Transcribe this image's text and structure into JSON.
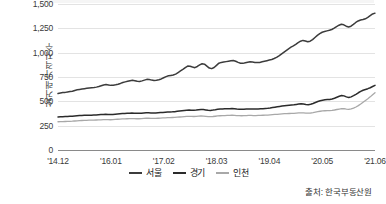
{
  "chart_data": {
    "type": "line",
    "title": "",
    "subtitle": "",
    "xlabel": "",
    "ylabel": "실거래 가격지수",
    "ylim": [
      0,
      1500
    ],
    "yticks": [
      0,
      250,
      500,
      750,
      1000,
      1250,
      1500
    ],
    "ytick_labels": [
      "0",
      "250",
      "500",
      "750",
      "1,000",
      "1,250",
      "1,500"
    ],
    "grid": true,
    "legend_position": "bottom-center",
    "xtick_labels": [
      "'14.12",
      "'16.01",
      "'17.02",
      "'18.03",
      "'19.04",
      "'20.05",
      "'21.06"
    ],
    "x_start": "'14.12",
    "x_end": "'21.06",
    "source": "출처: 한국부동산원",
    "series": [
      {
        "name": "서울",
        "color": "#3c3c3c",
        "values": [
          580,
          585,
          590,
          592,
          596,
          600,
          604,
          612,
          618,
          622,
          626,
          630,
          634,
          638,
          640,
          642,
          646,
          652,
          660,
          668,
          672,
          668,
          664,
          666,
          670,
          676,
          684,
          694,
          700,
          706,
          712,
          716,
          712,
          706,
          704,
          710,
          718,
          726,
          724,
          718,
          714,
          716,
          722,
          730,
          742,
          754,
          762,
          766,
          770,
          780,
          796,
          812,
          828,
          846,
          862,
          860,
          852,
          846,
          858,
          874,
          886,
          882,
          862,
          842,
          836,
          848,
          870,
          892,
          900,
          904,
          908,
          912,
          916,
          920,
          912,
          900,
          892,
          890,
          896,
          902,
          906,
          904,
          900,
          898,
          900,
          906,
          912,
          918,
          924,
          930,
          940,
          952,
          968,
          986,
          1004,
          1022,
          1040,
          1056,
          1070,
          1086,
          1104,
          1118,
          1126,
          1120,
          1112,
          1118,
          1134,
          1156,
          1178,
          1196,
          1210,
          1218,
          1224,
          1230,
          1238,
          1252,
          1268,
          1282,
          1292,
          1286,
          1272,
          1264,
          1272,
          1290,
          1310,
          1326,
          1336,
          1340,
          1348,
          1362,
          1380,
          1398,
          1406
        ]
      },
      {
        "name": "경기",
        "color": "#2b2b2b",
        "values": [
          340,
          341,
          342,
          343,
          344,
          346,
          348,
          350,
          352,
          354,
          355,
          356,
          357,
          358,
          358,
          359,
          360,
          362,
          364,
          366,
          367,
          366,
          365,
          366,
          368,
          370,
          372,
          374,
          376,
          377,
          378,
          379,
          378,
          377,
          377,
          378,
          380,
          382,
          382,
          381,
          380,
          380,
          382,
          384,
          386,
          388,
          390,
          391,
          392,
          394,
          397,
          400,
          403,
          406,
          409,
          410,
          409,
          408,
          410,
          414,
          417,
          416,
          412,
          408,
          407,
          410,
          414,
          419,
          421,
          422,
          423,
          424,
          425,
          426,
          424,
          421,
          419,
          418,
          419,
          421,
          422,
          422,
          421,
          420,
          421,
          423,
          425,
          427,
          429,
          432,
          436,
          440,
          444,
          448,
          452,
          455,
          458,
          460,
          462,
          464,
          468,
          472,
          474,
          472,
          468,
          466,
          470,
          478,
          488,
          498,
          506,
          512,
          516,
          518,
          520,
          524,
          532,
          542,
          552,
          560,
          556,
          546,
          540,
          546,
          558,
          572,
          588,
          602,
          614,
          622,
          630,
          640,
          652,
          664
        ]
      },
      {
        "name": "인천",
        "color": "#a8a8a8",
        "values": [
          290,
          291,
          292,
          293,
          294,
          295,
          296,
          298,
          300,
          302,
          303,
          304,
          305,
          306,
          306,
          307,
          308,
          309,
          310,
          312,
          313,
          312,
          311,
          312,
          314,
          316,
          318,
          319,
          320,
          321,
          322,
          323,
          322,
          321,
          321,
          322,
          324,
          326,
          326,
          325,
          324,
          324,
          326,
          328,
          330,
          331,
          332,
          333,
          334,
          335,
          337,
          339,
          341,
          343,
          345,
          346,
          345,
          344,
          346,
          348,
          350,
          349,
          346,
          343,
          342,
          344,
          347,
          350,
          352,
          353,
          354,
          355,
          356,
          357,
          356,
          354,
          353,
          352,
          353,
          354,
          355,
          355,
          354,
          354,
          355,
          356,
          357,
          358,
          359,
          361,
          363,
          365,
          367,
          369,
          371,
          373,
          374,
          375,
          376,
          377,
          379,
          381,
          382,
          381,
          379,
          378,
          380,
          384,
          389,
          394,
          398,
          401,
          403,
          404,
          405,
          407,
          411,
          416,
          421,
          425,
          424,
          420,
          418,
          422,
          430,
          442,
          456,
          472,
          490,
          508,
          526,
          546,
          568,
          588
        ]
      }
    ]
  },
  "legend": {
    "items": [
      {
        "label": "서울",
        "color": "#3c3c3c",
        "thickness": "2px"
      },
      {
        "label": "경기",
        "color": "#2b2b2b",
        "thickness": "2px"
      },
      {
        "label": "인천",
        "color": "#a8a8a8",
        "thickness": "2px"
      }
    ]
  },
  "source_note": "출처: 한국부동산원"
}
